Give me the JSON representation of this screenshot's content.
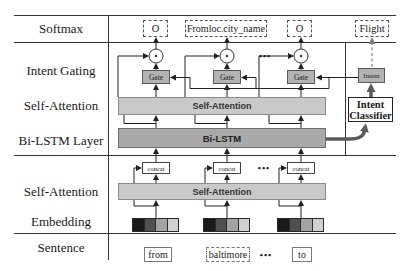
{
  "figure": {
    "row_labels": {
      "softmax": "Softmax",
      "intent_gating": "Intent Gating",
      "self_attention_upper": "Self-Attention",
      "bilstm_layer": "Bi-LSTM Layer",
      "self_attention_lower": "Self-Attention",
      "embedding": "Embedding",
      "sentence": "Sentence"
    },
    "units": [
      {
        "slot": "O",
        "gate": "Gate",
        "concat": "concat",
        "word": "from"
      },
      {
        "slot": "Fromloc.city_name",
        "gate": "Gate",
        "concat": "concat",
        "word": "baltimore"
      },
      {
        "slot": "O",
        "gate": "Gate",
        "concat": "concat",
        "word": "to"
      }
    ],
    "intent_branch": {
      "output": "Flight",
      "intent_box": "Intent",
      "classifier_line1": "Intent",
      "classifier_line2": "Classifier"
    },
    "bars": {
      "self_attention_upper": "Self-Attention",
      "bilstm": "Bi-LSTM",
      "self_attention_lower": "Self-Attention"
    },
    "ellipsis": "•••",
    "embedding_colors": [
      "#1a1a1a",
      "#505050",
      "#a3a3a3",
      "#d0d0d0"
    ],
    "colors": {
      "bar_light": "#c9c9c9",
      "bar_dark": "#a9a9a9",
      "gate_fill": "#b3b3b3",
      "arrow_thick": "#5a5a5a",
      "line": "#333333"
    }
  }
}
